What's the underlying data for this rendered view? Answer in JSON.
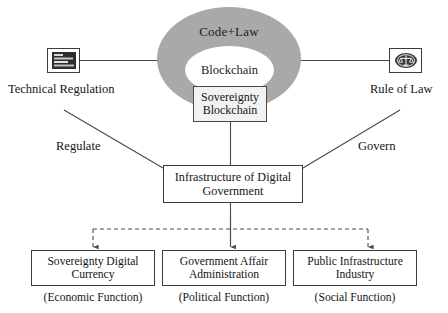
{
  "diagram": {
    "core": {
      "outer_label": "Code+Law",
      "inner_label": "Blockchain",
      "sovereignty_line1": "Sovereignty",
      "sovereignty_line2": "Blockchain",
      "ellipse_color": "#a9a9a9",
      "inner_color": "#ffffff",
      "sovereignty_color": "#f2f2f2"
    },
    "left": {
      "icon": "code-lines-icon",
      "label": "Technical Regulation",
      "verb": "Regulate"
    },
    "right": {
      "icon": "law-seal-icon",
      "label": "Rule of Law",
      "verb": "Govern"
    },
    "infrastructure": {
      "line1": "Infrastructure of Digital",
      "line2": "Government"
    },
    "outcomes": [
      {
        "line1": "Sovereignty Digital",
        "line2": "Currency",
        "caption": "(Economic Function)"
      },
      {
        "line1": "Government Affair",
        "line2": "Administration",
        "caption": "(Political Function)"
      },
      {
        "line1": "Public Infrastructure",
        "line2": "Industry",
        "caption": "(Social Function)"
      }
    ],
    "edges": {
      "stroke_color": "#4a4a4a",
      "dashed_color": "#4a4a4a"
    }
  }
}
